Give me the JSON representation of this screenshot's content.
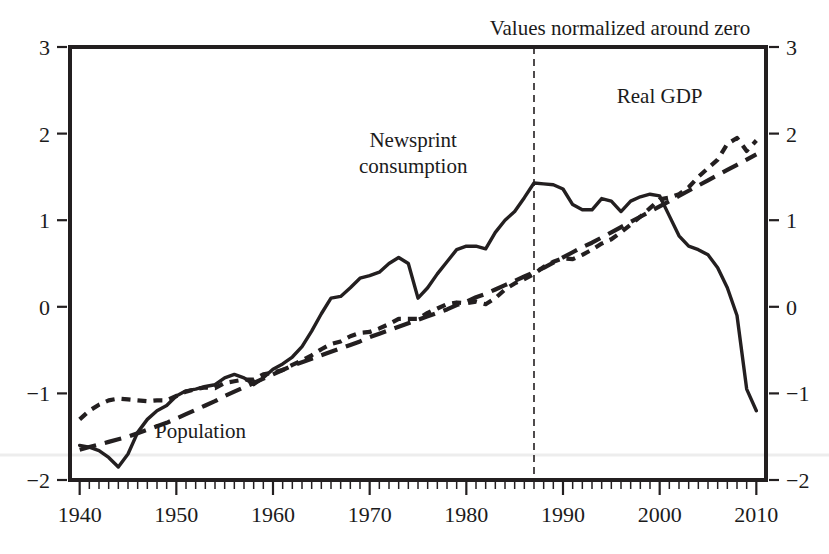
{
  "chart_data": {
    "type": "line",
    "title": "Values normalized around zero",
    "xlabel": "",
    "ylabel": "",
    "xlim": [
      1939,
      2011
    ],
    "ylim": [
      -2,
      3
    ],
    "xticks": [
      1940,
      1950,
      1960,
      1970,
      1980,
      1990,
      2000,
      2010
    ],
    "xticklabels": [
      "1940",
      "1950",
      "1960",
      "1970",
      "1980",
      "1990",
      "2000",
      "2010"
    ],
    "yticks": [
      -2,
      -1,
      0,
      1,
      2,
      3
    ],
    "yticklabels_left": [
      "−2",
      "−1",
      "0",
      "1",
      "2",
      "3"
    ],
    "yticklabels_right": [
      "−2",
      "−1",
      "0",
      "1",
      "2",
      "3"
    ],
    "minor_x_step": 1,
    "grid": false,
    "legend_position": "inline-annotations",
    "right_axis_mirrored": true,
    "annotations": [
      {
        "name": "newsprint-consumption-label",
        "text": "Newsprint\nconsumption",
        "x": 1974.5,
        "y": 1.85
      },
      {
        "name": "real-gdp-label",
        "text": "Real GDP",
        "x": 2000.0,
        "y": 2.35
      },
      {
        "name": "population-label",
        "text": "Population",
        "x": 1952.5,
        "y": -1.52
      }
    ],
    "vertical_marker": {
      "name": "divider-1987",
      "x": 1987,
      "style": "dashed"
    },
    "series": [
      {
        "name": "Newsprint consumption",
        "style": "solid",
        "x": [
          1940,
          1941,
          1942,
          1943,
          1944,
          1945,
          1946,
          1947,
          1948,
          1949,
          1950,
          1951,
          1952,
          1953,
          1954,
          1955,
          1956,
          1957,
          1958,
          1959,
          1960,
          1961,
          1962,
          1963,
          1964,
          1965,
          1966,
          1967,
          1968,
          1969,
          1970,
          1971,
          1972,
          1973,
          1974,
          1975,
          1976,
          1977,
          1978,
          1979,
          1980,
          1981,
          1982,
          1983,
          1984,
          1985,
          1986,
          1987,
          1988,
          1989,
          1990,
          1991,
          1992,
          1993,
          1994,
          1995,
          1996,
          1997,
          1998,
          1999,
          2000,
          2001,
          2002,
          2003,
          2004,
          2005,
          2006,
          2007,
          2008,
          2009,
          2010
        ],
        "values": [
          -1.6,
          -1.62,
          -1.66,
          -1.74,
          -1.85,
          -1.7,
          -1.45,
          -1.3,
          -1.2,
          -1.14,
          -1.03,
          -0.97,
          -0.95,
          -0.92,
          -0.9,
          -0.82,
          -0.78,
          -0.82,
          -0.9,
          -0.82,
          -0.72,
          -0.66,
          -0.58,
          -0.46,
          -0.28,
          -0.08,
          0.1,
          0.12,
          0.22,
          0.33,
          0.36,
          0.4,
          0.5,
          0.57,
          0.5,
          0.1,
          0.22,
          0.38,
          0.52,
          0.66,
          0.7,
          0.7,
          0.67,
          0.86,
          1.0,
          1.1,
          1.26,
          1.43,
          1.42,
          1.41,
          1.36,
          1.18,
          1.12,
          1.12,
          1.25,
          1.22,
          1.1,
          1.22,
          1.27,
          1.3,
          1.28,
          1.05,
          0.82,
          0.7,
          0.66,
          0.6,
          0.45,
          0.22,
          -0.1,
          -0.95,
          -1.2
        ]
      },
      {
        "name": "Real GDP",
        "style": "short-dash",
        "x": [
          1940,
          1941,
          1942,
          1943,
          1944,
          1945,
          1946,
          1947,
          1948,
          1949,
          1950,
          1951,
          1952,
          1953,
          1954,
          1955,
          1956,
          1957,
          1958,
          1959,
          1960,
          1961,
          1962,
          1963,
          1964,
          1965,
          1966,
          1967,
          1968,
          1969,
          1970,
          1971,
          1972,
          1973,
          1974,
          1975,
          1976,
          1977,
          1978,
          1979,
          1980,
          1981,
          1982,
          1983,
          1984,
          1985,
          1986,
          1987,
          1988,
          1989,
          1990,
          1991,
          1992,
          1993,
          1994,
          1995,
          1996,
          1997,
          1998,
          1999,
          2000,
          2001,
          2002,
          2003,
          2004,
          2005,
          2006,
          2007,
          2008,
          2009,
          2010
        ],
        "values": [
          -1.3,
          -1.2,
          -1.13,
          -1.08,
          -1.06,
          -1.07,
          -1.08,
          -1.09,
          -1.08,
          -1.08,
          -1.03,
          -0.98,
          -0.95,
          -0.93,
          -0.94,
          -0.88,
          -0.86,
          -0.84,
          -0.84,
          -0.78,
          -0.76,
          -0.73,
          -0.67,
          -0.62,
          -0.56,
          -0.49,
          -0.43,
          -0.4,
          -0.34,
          -0.3,
          -0.29,
          -0.25,
          -0.2,
          -0.14,
          -0.14,
          -0.14,
          -0.07,
          -0.02,
          0.03,
          0.05,
          0.04,
          0.06,
          0.03,
          0.1,
          0.2,
          0.27,
          0.32,
          0.38,
          0.46,
          0.52,
          0.56,
          0.55,
          0.6,
          0.66,
          0.73,
          0.78,
          0.86,
          0.95,
          1.04,
          1.14,
          1.24,
          1.26,
          1.3,
          1.38,
          1.5,
          1.6,
          1.7,
          1.88,
          1.95,
          1.8,
          1.92
        ]
      },
      {
        "name": "Population",
        "style": "long-dash",
        "x": [
          1940,
          1941,
          1942,
          1943,
          1944,
          1945,
          1946,
          1947,
          1948,
          1949,
          1950,
          1951,
          1952,
          1953,
          1954,
          1955,
          1956,
          1957,
          1958,
          1959,
          1960,
          1961,
          1962,
          1963,
          1964,
          1965,
          1966,
          1967,
          1968,
          1969,
          1970,
          1971,
          1972,
          1973,
          1974,
          1975,
          1976,
          1977,
          1978,
          1979,
          1980,
          1981,
          1982,
          1983,
          1984,
          1985,
          1986,
          1987,
          1988,
          1989,
          1990,
          1991,
          1992,
          1993,
          1994,
          1995,
          1996,
          1997,
          1998,
          1999,
          2000,
          2001,
          2002,
          2003,
          2004,
          2005,
          2006,
          2007,
          2008,
          2009,
          2010
        ],
        "values": [
          -1.65,
          -1.62,
          -1.59,
          -1.56,
          -1.53,
          -1.5,
          -1.46,
          -1.42,
          -1.38,
          -1.34,
          -1.29,
          -1.24,
          -1.19,
          -1.14,
          -1.09,
          -1.03,
          -0.98,
          -0.93,
          -0.88,
          -0.83,
          -0.78,
          -0.73,
          -0.68,
          -0.64,
          -0.6,
          -0.56,
          -0.52,
          -0.48,
          -0.44,
          -0.4,
          -0.35,
          -0.31,
          -0.27,
          -0.23,
          -0.19,
          -0.15,
          -0.11,
          -0.07,
          -0.03,
          0.02,
          0.06,
          0.11,
          0.15,
          0.2,
          0.25,
          0.3,
          0.35,
          0.4,
          0.45,
          0.51,
          0.57,
          0.63,
          0.69,
          0.74,
          0.8,
          0.86,
          0.92,
          0.98,
          1.04,
          1.1,
          1.16,
          1.22,
          1.28,
          1.34,
          1.4,
          1.46,
          1.52,
          1.58,
          1.64,
          1.7,
          1.76
        ]
      }
    ],
    "colors": {
      "axis": "#231f20",
      "series": "#231f20",
      "background": "#ffffff"
    }
  }
}
